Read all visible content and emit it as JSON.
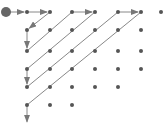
{
  "diagram": {
    "colors": {
      "dot": "#555555",
      "line": "#888888",
      "start": "#666666",
      "background": "#ffffff"
    },
    "columns_x": [
      6,
      27,
      50,
      72,
      95,
      118,
      141,
      161
    ],
    "rows_y": [
      12,
      30,
      51,
      69,
      87,
      105
    ],
    "start": {
      "col": 0,
      "row": 0,
      "radius": 5
    },
    "dots": [
      {
        "col": 1,
        "row": 0
      },
      {
        "col": 2,
        "row": 0
      },
      {
        "col": 3,
        "row": 0
      },
      {
        "col": 4,
        "row": 0
      },
      {
        "col": 5,
        "row": 0
      },
      {
        "col": 6,
        "row": 0
      },
      {
        "col": 7,
        "row": 0
      },
      {
        "col": 1,
        "row": 1
      },
      {
        "col": 2,
        "row": 1
      },
      {
        "col": 3,
        "row": 1
      },
      {
        "col": 4,
        "row": 1
      },
      {
        "col": 5,
        "row": 1
      },
      {
        "col": 6,
        "row": 1
      },
      {
        "col": 1,
        "row": 2
      },
      {
        "col": 2,
        "row": 2
      },
      {
        "col": 3,
        "row": 2
      },
      {
        "col": 4,
        "row": 2
      },
      {
        "col": 5,
        "row": 2
      },
      {
        "col": 6,
        "row": 2
      },
      {
        "col": 1,
        "row": 3
      },
      {
        "col": 2,
        "row": 3
      },
      {
        "col": 3,
        "row": 3
      },
      {
        "col": 4,
        "row": 3
      },
      {
        "col": 5,
        "row": 3
      },
      {
        "col": 6,
        "row": 3
      },
      {
        "col": 1,
        "row": 4
      },
      {
        "col": 2,
        "row": 4
      },
      {
        "col": 3,
        "row": 4
      },
      {
        "col": 4,
        "row": 4
      },
      {
        "col": 5,
        "row": 4
      },
      {
        "col": 1,
        "row": 5
      },
      {
        "col": 2,
        "row": 5
      },
      {
        "col": 3,
        "row": 5
      }
    ],
    "path": [
      {
        "from": [
          0,
          0
        ],
        "to": [
          1,
          0
        ],
        "arrow": true
      },
      {
        "from": [
          1,
          0
        ],
        "to": [
          2,
          0
        ],
        "arrow": true
      },
      {
        "from": [
          2,
          0
        ],
        "to": [
          1,
          1
        ],
        "arrow": true
      },
      {
        "from": [
          1,
          1
        ],
        "to": [
          1,
          2
        ],
        "arrow": true
      },
      {
        "from": [
          1,
          2
        ],
        "to": [
          3,
          0
        ],
        "arrow": false
      },
      {
        "from": [
          3,
          0
        ],
        "to": [
          4,
          0
        ],
        "arrow": true
      },
      {
        "from": [
          4,
          0
        ],
        "to": [
          1,
          3
        ],
        "arrow": false
      },
      {
        "from": [
          1,
          3
        ],
        "to": [
          1,
          4
        ],
        "arrow": true
      },
      {
        "from": [
          1,
          4
        ],
        "to": [
          5,
          0
        ],
        "arrow": false
      },
      {
        "from": [
          5,
          0
        ],
        "to": [
          6,
          0
        ],
        "arrow": true
      },
      {
        "from": [
          6,
          0
        ],
        "to": [
          1,
          5
        ],
        "arrow": false
      },
      {
        "from": [
          1,
          5
        ],
        "to": [
          1,
          6.1
        ],
        "arrow": true
      }
    ]
  }
}
